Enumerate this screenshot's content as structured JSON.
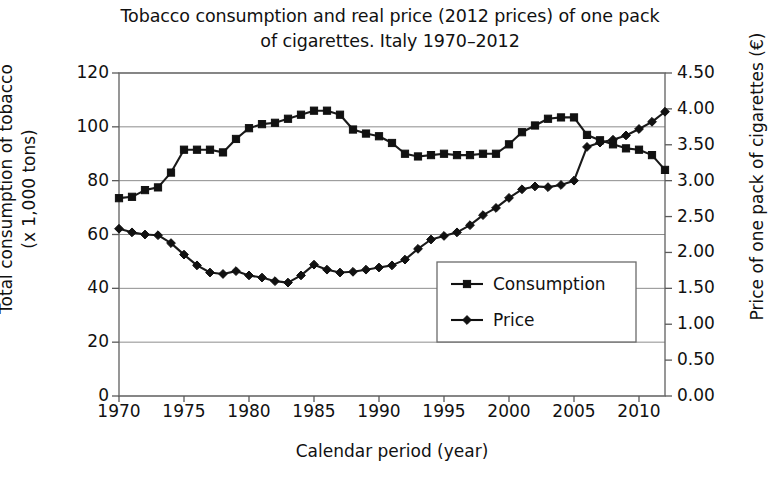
{
  "chart_data": {
    "type": "line",
    "title": "Tobacco consumption and real price (2012 prices) of one pack of cigarettes. Italy 1970–2012",
    "title_line1": "Tobacco consumption and real price (2012 prices) of one pack",
    "title_line2": "of cigarettes. Italy 1970–2012",
    "xlabel": "Calendar period (year)",
    "ylabel": "Total consumption of tobacco (x 1,000 tons)",
    "ylabel_line1": "Total consumption of tobacco",
    "ylabel_line2": "(x 1,000 tons)",
    "ylabel_right": "Price of one pack of cigarettes (€)",
    "xlim": [
      1970,
      2012
    ],
    "ylim": [
      0,
      120
    ],
    "ylim_right": [
      0.0,
      4.5
    ],
    "grid": true,
    "grid_axis": "y",
    "legend_position": "center-right",
    "xticks": [
      1970,
      1975,
      1980,
      1985,
      1990,
      1995,
      2000,
      2005,
      2010
    ],
    "xticklabels": [
      "1970",
      "1975",
      "1980",
      "1985",
      "1990",
      "1995",
      "2000",
      "2005",
      "2010"
    ],
    "yticks": [
      0,
      20,
      40,
      60,
      80,
      100,
      120
    ],
    "yticklabels": [
      "0",
      "20",
      "40",
      "60",
      "80",
      "100",
      "120"
    ],
    "yticks_right": [
      0.0,
      0.5,
      1.0,
      1.5,
      2.0,
      2.5,
      3.0,
      3.5,
      4.0,
      4.5
    ],
    "yticklabels_right": [
      "0.00",
      "0.50",
      "1.00",
      "1.50",
      "2.00",
      "2.50",
      "3.00",
      "3.50",
      "4.00",
      "4.50"
    ],
    "x": [
      1970,
      1971,
      1972,
      1973,
      1974,
      1975,
      1976,
      1977,
      1978,
      1979,
      1980,
      1981,
      1982,
      1983,
      1984,
      1985,
      1986,
      1987,
      1988,
      1989,
      1990,
      1991,
      1992,
      1993,
      1994,
      1995,
      1996,
      1997,
      1998,
      1999,
      2000,
      2001,
      2002,
      2003,
      2004,
      2005,
      2006,
      2007,
      2008,
      2009,
      2010,
      2011,
      2012
    ],
    "series": [
      {
        "name": "Consumption",
        "axis": "left",
        "marker": "square",
        "color": "#1a1a1a",
        "unit": "x 1,000 tons",
        "values": [
          73.5,
          74.0,
          76.5,
          77.5,
          83.0,
          91.5,
          91.5,
          91.5,
          90.5,
          95.5,
          99.5,
          101.0,
          101.5,
          103.0,
          104.5,
          106.0,
          106.0,
          104.5,
          99.0,
          97.5,
          96.5,
          94.0,
          90.0,
          89.0,
          89.5,
          90.0,
          89.5,
          89.5,
          90.0,
          90.0,
          93.5,
          98.0,
          100.5,
          103.0,
          103.5,
          103.5,
          97.0,
          95.0,
          93.5,
          92.0,
          91.5,
          89.5,
          84.0
        ]
      },
      {
        "name": "Price",
        "axis": "right",
        "marker": "diamond",
        "color": "#1a1a1a",
        "unit": "€ per pack",
        "values": [
          2.33,
          2.28,
          2.25,
          2.24,
          2.13,
          1.97,
          1.82,
          1.72,
          1.7,
          1.74,
          1.68,
          1.65,
          1.6,
          1.58,
          1.68,
          1.83,
          1.76,
          1.72,
          1.73,
          1.76,
          1.79,
          1.82,
          1.9,
          2.05,
          2.18,
          2.23,
          2.28,
          2.38,
          2.52,
          2.62,
          2.76,
          2.88,
          2.92,
          2.91,
          2.94,
          3.0,
          3.47,
          3.53,
          3.57,
          3.63,
          3.72,
          3.82,
          3.96
        ]
      }
    ],
    "annotations": {
      "peak_consumption_year": 1986,
      "peak_consumption_value": 106,
      "min_price_year": 1983,
      "min_price_value": 1.58,
      "crossover_year": 2005
    }
  },
  "legend": {
    "items": [
      {
        "label": "Consumption",
        "marker": "square"
      },
      {
        "label": "Price",
        "marker": "diamond"
      }
    ]
  }
}
